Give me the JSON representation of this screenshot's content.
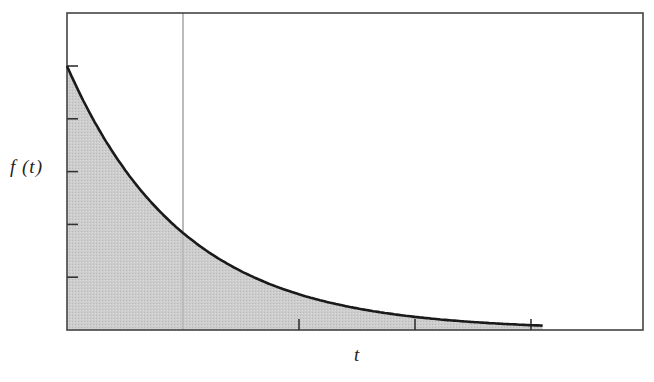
{
  "chart_data": {
    "type": "area",
    "title": "",
    "xlabel": "t",
    "ylabel": "f (t)",
    "function": "f(t) = e^(-t)",
    "x": [
      0,
      0.25,
      0.5,
      0.75,
      1.0,
      1.25,
      1.5,
      1.75,
      2.0,
      2.25,
      2.5,
      2.75,
      3.0,
      3.25,
      3.5,
      3.75,
      4.0,
      4.1
    ],
    "values": [
      1.0,
      0.779,
      0.607,
      0.472,
      0.368,
      0.287,
      0.223,
      0.174,
      0.135,
      0.105,
      0.082,
      0.064,
      0.05,
      0.039,
      0.03,
      0.024,
      0.018,
      0.017
    ],
    "xlim": [
      0,
      5
    ],
    "ylim": [
      0,
      1.2
    ],
    "x_ticks": [
      2,
      3,
      4
    ],
    "y_ticks": [
      0.2,
      0.4,
      0.6,
      0.8,
      1.0
    ],
    "tick_labels_shown": false,
    "reference_line": {
      "orientation": "vertical",
      "x": 1.0,
      "color": "#bbbbbb"
    },
    "fill": {
      "under_curve": true,
      "color": "#c8c8c8"
    },
    "curve_color": "#1a1a1a",
    "frame_color": "#444444",
    "grid": false,
    "legend": null
  },
  "labels": {
    "y_axis": "f (t)",
    "x_axis": "t"
  },
  "layout": {
    "plot_left": 67,
    "plot_top": 13,
    "plot_right": 643,
    "plot_bottom": 330,
    "px_per_x_unit": 116,
    "px_per_y_unit": 264
  }
}
